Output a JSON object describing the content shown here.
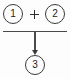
{
  "diagram": {
    "type": "sum-junction-flow",
    "background_color": "#fdfdfd",
    "stroke_color": "#3a3a3a",
    "nodes": [
      {
        "id": "operand-1",
        "label": "1",
        "shape": "circle",
        "role": "input"
      },
      {
        "id": "operand-2",
        "label": "2",
        "shape": "circle",
        "role": "input"
      },
      {
        "id": "result-3",
        "label": "3",
        "shape": "circle",
        "role": "output"
      }
    ],
    "operator": {
      "name": "plus-sign",
      "symbol": "+"
    },
    "connector": {
      "name": "merge-arrow",
      "direction": "down",
      "from": [
        "operand-1",
        "operand-2"
      ],
      "to": "result-3"
    }
  }
}
